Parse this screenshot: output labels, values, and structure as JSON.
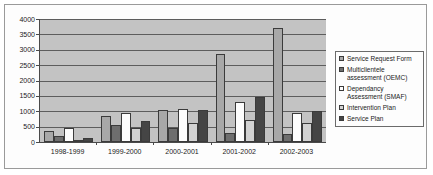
{
  "chart_data": {
    "type": "bar",
    "title": "",
    "xlabel": "",
    "ylabel": "",
    "ylim": [
      0,
      4000
    ],
    "ytick_step": 500,
    "yticks": [
      "4000",
      "3500",
      "3000",
      "2500",
      "2000",
      "1500",
      "1000",
      "500",
      "0"
    ],
    "grid": true,
    "legend_position": "right",
    "categories": [
      "1998-1999",
      "1999-2000",
      "2000-2001",
      "2001-2002",
      "2002-2003"
    ],
    "series": [
      {
        "name": "Service Request Form",
        "color": "#a8a8a8",
        "values": [
          370,
          860,
          1050,
          2850,
          3720
        ]
      },
      {
        "name": "Multiclientele assessment (OEMC)",
        "color": "#6e6e6e",
        "values": [
          210,
          560,
          460,
          300,
          270
        ]
      },
      {
        "name": "Dependancy Assessment (SMAF)",
        "color": "#fdfdfd",
        "values": [
          460,
          950,
          1060,
          1300,
          930
        ]
      },
      {
        "name": "Intervention Plan",
        "color": "#d2d2d2",
        "values": [
          60,
          470,
          610,
          700,
          620
        ]
      },
      {
        "name": "Service Plan",
        "color": "#454545",
        "values": [
          120,
          680,
          1050,
          1450,
          1000
        ]
      }
    ]
  },
  "legend": {
    "items": [
      {
        "label": "Service Request Form",
        "color": "#a8a8a8"
      },
      {
        "label": "Multiclientele\nassessment (OEMC)",
        "color": "#6e6e6e"
      },
      {
        "label": "Dependancy\nAssessment (SMAF)",
        "color": "#fdfdfd"
      },
      {
        "label": "Intervention Plan",
        "color": "#d2d2d2"
      },
      {
        "label": "Service Plan",
        "color": "#454545"
      }
    ]
  }
}
